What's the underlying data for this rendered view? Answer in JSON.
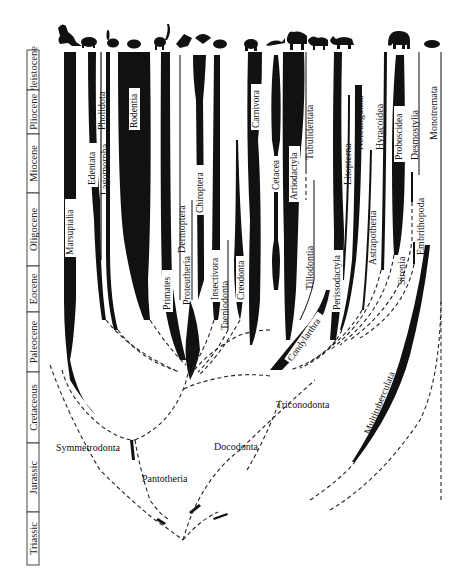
{
  "time_scale": {
    "periods": [
      {
        "name": "Pleistocene",
        "y0": 50,
        "y1": 90
      },
      {
        "name": "Pliocene",
        "y0": 90,
        "y1": 134
      },
      {
        "name": "Miocene",
        "y0": 134,
        "y1": 193
      },
      {
        "name": "Oligocene",
        "y0": 193,
        "y1": 266
      },
      {
        "name": "Eocene",
        "y0": 266,
        "y1": 312
      },
      {
        "name": "Paleocene",
        "y0": 312,
        "y1": 372
      },
      {
        "name": "Cretaceous",
        "y0": 372,
        "y1": 443
      },
      {
        "name": "Jurassic",
        "y0": 443,
        "y1": 512
      },
      {
        "name": "Triassic",
        "y0": 512,
        "y1": 565
      }
    ]
  },
  "labels": {
    "marsupialia": "Marsupialia",
    "edentata": "Edentata",
    "pholidota": "Pholidota",
    "lagomorpha": "Lagomorpha",
    "rodentia": "Rodentia",
    "primates": "Primates",
    "dermoptera": "Dermoptera",
    "proteutheria": "Proteutheria",
    "chiroptera": "Chiroptera",
    "insectivora": "Insectivora",
    "taeniodonta": "Taeniodonta",
    "creodonta": "Creodonta",
    "carnivora": "Carnivora",
    "cetacea": "Cetacea",
    "artiodactyla": "Artiodactyla",
    "tubulidentata": "Tubulidentata",
    "tillodontia": "Tillodontia",
    "condylarthra": "Condylarthra",
    "perissodactyla": "Perissodactyla",
    "litopterna": "Litopterna",
    "notoungulata": "Notoungulata",
    "astrapotheria": "Astrapotheria",
    "hyracoidea": "Hyracoidea",
    "proboscidea": "Proboscidea",
    "sirenia": "Sirenia",
    "desmostylia": "Desmostylia",
    "embrithopoda": "Embrithopoda",
    "monotremata": "Monotremata",
    "multituberculata": "Multituberculata",
    "triconodonta": "Triconodonta",
    "docodonta": "Docodonta",
    "symmetrodonta": "Symmetrodonta",
    "pantotheria": "Pantotheria"
  },
  "animals": [
    "kangaroo-icon",
    "armadillo-icon",
    "rabbit-icon",
    "rodent-icon",
    "lemur-icon",
    "bat-icon",
    "pangolin-icon",
    "hedgehog-icon",
    "bear-icon",
    "dolphin-icon",
    "bison-icon",
    "horse-icon",
    "rhinoceros-icon",
    "elephant-icon",
    "platypus-icon"
  ]
}
